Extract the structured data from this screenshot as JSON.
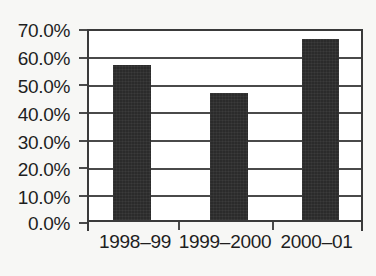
{
  "chart_data": {
    "type": "bar",
    "title": "",
    "subtitle": "",
    "xlabel": "",
    "ylabel": "",
    "categories": [
      "1998–99",
      "1999–2000",
      "2000–01"
    ],
    "values": [
      57.5,
      47.0,
      67.0
    ],
    "value_labels": [
      "57.5%",
      "47.0%",
      "67.0%"
    ],
    "ylim": [
      0,
      70
    ],
    "ytick_values": [
      0,
      10,
      20,
      30,
      40,
      50,
      60,
      70
    ],
    "ytick_labels": [
      "0.0%",
      "10.0%",
      "20.0%",
      "30.0%",
      "40.0%",
      "50.0%",
      "60.0%",
      "70.0%"
    ],
    "grid": true,
    "grid_axis": "y",
    "legend": false,
    "legend_position": "none",
    "series": [
      {
        "name": "",
        "values": [
          57.5,
          47.0,
          67.0
        ]
      }
    ],
    "colors": {
      "bar_fill": "#2b2b2b",
      "axis": "#3a3a3a",
      "gridline": "#4a4a4a",
      "text": "#1e1e1e",
      "plot_background": "#ffffff",
      "figure_background": "#f7f7f5"
    }
  }
}
